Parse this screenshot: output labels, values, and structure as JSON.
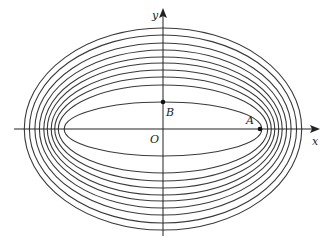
{
  "diagram": {
    "type": "confocal-ellipses",
    "center": [
      163,
      129
    ],
    "focal_c": 95,
    "semi_minor_axes": [
      27,
      44,
      52,
      59,
      66,
      72,
      79,
      86,
      94,
      101
    ],
    "stroke_color": "#3a3a3a",
    "axis_color": "#222222",
    "labels": {
      "x_axis": "x",
      "y_axis": "y",
      "origin": "O",
      "point_a": "A",
      "point_b": "B"
    },
    "points": {
      "A": [
        260,
        129
      ],
      "B": [
        163,
        102
      ]
    }
  }
}
